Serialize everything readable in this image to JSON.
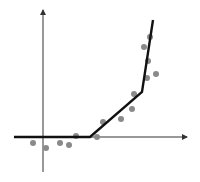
{
  "chart_data": {
    "type": "scatter",
    "title": "",
    "xlabel": "",
    "ylabel": "",
    "grid": false,
    "legend": "none",
    "annotations": [],
    "colors": {
      "points": "#8a8a8a",
      "line": "#111111",
      "axes": "#333333"
    },
    "axes_px": {
      "origin": [
        43,
        137
      ],
      "x_axis": {
        "from": [
          14,
          137
        ],
        "to": [
          187,
          137
        ]
      },
      "y_axis": {
        "from": [
          43,
          172
        ],
        "to": [
          43,
          10
        ]
      }
    },
    "fit_line_px": [
      [
        14,
        137
      ],
      [
        90,
        137
      ],
      [
        142,
        92
      ],
      [
        153,
        20
      ]
    ],
    "points_px": [
      [
        33,
        143
      ],
      [
        46,
        148
      ],
      [
        60,
        143
      ],
      [
        69,
        145
      ],
      [
        76,
        136
      ],
      [
        97,
        137
      ],
      [
        103,
        122
      ],
      [
        121,
        119
      ],
      [
        132,
        109
      ],
      [
        134,
        94
      ],
      [
        147,
        78
      ],
      [
        148,
        61
      ],
      [
        156,
        74
      ],
      [
        144,
        47
      ],
      [
        150,
        37
      ]
    ],
    "series": [
      {
        "name": "data",
        "x": [
          -10,
          3,
          17,
          26,
          33,
          54,
          60,
          78,
          89,
          91,
          104,
          105,
          113,
          101,
          107
        ],
        "y": [
          -6,
          -11,
          -6,
          -8,
          1,
          0,
          15,
          18,
          28,
          43,
          59,
          76,
          63,
          90,
          100
        ]
      },
      {
        "name": "piecewise fit",
        "x": [
          -29,
          47,
          99,
          110
        ],
        "y": [
          0,
          0,
          45,
          117
        ]
      }
    ]
  }
}
